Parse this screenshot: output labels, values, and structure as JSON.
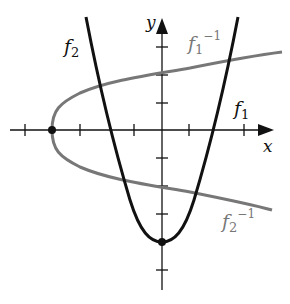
{
  "figure": {
    "axes": {
      "x_label": "x",
      "y_label": "y"
    },
    "curves": [
      {
        "id": "f1",
        "name": "f",
        "sub": "1",
        "sup": "",
        "color": "#111111"
      },
      {
        "id": "f2",
        "name": "f",
        "sub": "2",
        "sup": "",
        "color": "#111111"
      },
      {
        "id": "f1_inv",
        "name": "f",
        "sub": "1",
        "sup": "−1",
        "color": "#777777"
      },
      {
        "id": "f2_inv",
        "name": "f",
        "sub": "2",
        "sup": "−1",
        "color": "#777777"
      }
    ],
    "points": [
      {
        "x": 0,
        "y": -4
      },
      {
        "x": -4,
        "y": 0
      }
    ]
  }
}
